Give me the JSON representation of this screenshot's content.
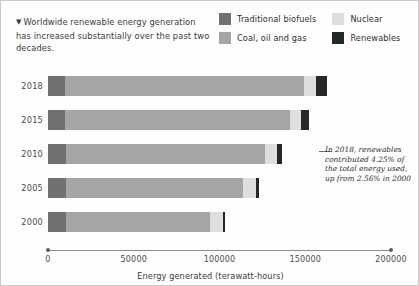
{
  "header": {
    "marker_icon": "triangle-down-icon",
    "headline": "Worldwide renewable energy generation has increased substantially over the past two decades."
  },
  "legend": {
    "position": "top-right",
    "items": [
      {
        "label": "Traditional biofuels",
        "color": "#707070",
        "key": "biofuels"
      },
      {
        "label": "Nuclear",
        "color": "#dedede",
        "key": "nuclear"
      },
      {
        "label": "Coal, oil and gas",
        "color": "#a5a5a5",
        "key": "fossil"
      },
      {
        "label": "Renewables",
        "color": "#272727",
        "key": "renewables"
      }
    ]
  },
  "annotation": {
    "text": "In 2018, renewables contributed 4.25% of the total energy used, up from 2.56% in 2000",
    "leader_line": true
  },
  "axis": {
    "title": "Energy generated (terawatt-hours)",
    "ticks": [
      "0",
      "50000",
      "100000",
      "150000",
      "200000"
    ],
    "min": 0,
    "max": 200000
  },
  "chart_data": {
    "type": "bar",
    "orientation": "horizontal",
    "stacked": true,
    "title": "Worldwide renewable energy generation has increased substantially over the past two decades.",
    "xlabel": "Energy generated (terawatt-hours)",
    "ylabel": "",
    "xlim": [
      0,
      200000
    ],
    "grid": false,
    "legend_position": "top-right",
    "categories": [
      "2018",
      "2015",
      "2010",
      "2005",
      "2000"
    ],
    "series": [
      {
        "name": "Traditional biofuels",
        "color": "#707070",
        "values": [
          10000,
          10000,
          10500,
          10500,
          10500
        ]
      },
      {
        "name": "Coal, oil and gas",
        "color": "#a5a5a5",
        "values": [
          139000,
          131000,
          116000,
          103000,
          84000
        ]
      },
      {
        "name": "Nuclear",
        "color": "#dedede",
        "values": [
          7000,
          6500,
          7000,
          7500,
          7500
        ]
      },
      {
        "name": "Renewables",
        "color": "#272727",
        "values": [
          6500,
          4500,
          3000,
          2000,
          1500
        ]
      }
    ],
    "totals": [
      162500,
      152000,
      136500,
      123000,
      103500
    ],
    "annotations": [
      {
        "attached_to": "2018",
        "text": "In 2018, renewables contributed 4.25% of the total energy used, up from 2.56% in 2000"
      }
    ]
  }
}
